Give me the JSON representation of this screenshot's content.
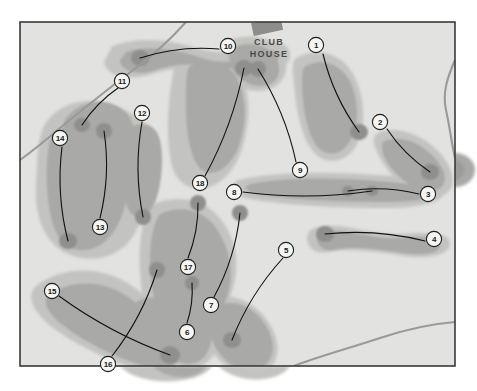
{
  "map": {
    "title": "Golf Course Layout Map",
    "clubhouse_label_line1": "CLUB",
    "clubhouse_label_line2": "HOUSE",
    "colors": {
      "page_background": "#ffffff",
      "map_background": "#e2e2e0",
      "rough": "#c3c3c1",
      "fairway": "#a9a9a7",
      "green": "#8f8f8d",
      "border": "#3a3a3a",
      "river": "#9a9a98",
      "marker_fill": "#f4f4f2",
      "marker_stroke": "#1f1f1f",
      "hole_line": "#111111",
      "clubhouse_fill": "#8d8d8b",
      "text": "#1a1a1a"
    },
    "frame": {
      "x": 20,
      "y": 22,
      "width": 435,
      "height": 344
    },
    "holes": [
      {
        "number": "1",
        "marker_x": 316,
        "marker_y": 45,
        "tee_x": 323,
        "tee_y": 54,
        "green_x": 359,
        "green_y": 132
      },
      {
        "number": "2",
        "marker_x": 380,
        "marker_y": 122,
        "tee_x": 387,
        "tee_y": 129,
        "green_x": 430,
        "green_y": 172
      },
      {
        "number": "3",
        "marker_x": 428,
        "marker_y": 194,
        "tee_x": 419,
        "tee_y": 194,
        "green_x": 348,
        "green_y": 191
      },
      {
        "number": "4",
        "marker_x": 434,
        "marker_y": 239,
        "tee_x": 425,
        "tee_y": 241,
        "green_x": 325,
        "green_y": 234
      },
      {
        "number": "5",
        "marker_x": 286,
        "marker_y": 250,
        "tee_x": 283,
        "tee_y": 258,
        "green_x": 232,
        "green_y": 340
      },
      {
        "number": "6",
        "marker_x": 187,
        "marker_y": 332,
        "tee_x": 187,
        "tee_y": 323,
        "green_x": 192,
        "green_y": 283
      },
      {
        "number": "7",
        "marker_x": 211,
        "marker_y": 305,
        "tee_x": 214,
        "tee_y": 297,
        "green_x": 240,
        "green_y": 213
      },
      {
        "number": "8",
        "marker_x": 234,
        "marker_y": 192,
        "tee_x": 243,
        "tee_y": 192,
        "green_x": 372,
        "green_y": 191
      },
      {
        "number": "9",
        "marker_x": 300,
        "marker_y": 170,
        "tee_x": 296,
        "tee_y": 162,
        "green_x": 258,
        "green_y": 69
      },
      {
        "number": "10",
        "marker_x": 228,
        "marker_y": 46,
        "tee_x": 219,
        "tee_y": 49,
        "green_x": 140,
        "green_y": 58
      },
      {
        "number": "11",
        "marker_x": 122,
        "marker_y": 81,
        "tee_x": 118,
        "tee_y": 88,
        "green_x": 82,
        "green_y": 125
      },
      {
        "number": "12",
        "marker_x": 142,
        "marker_y": 113,
        "tee_x": 142,
        "tee_y": 122,
        "green_x": 143,
        "green_y": 217
      },
      {
        "number": "13",
        "marker_x": 100,
        "marker_y": 227,
        "tee_x": 100,
        "tee_y": 218,
        "green_x": 104,
        "green_y": 131
      },
      {
        "number": "14",
        "marker_x": 60,
        "marker_y": 138,
        "tee_x": 62,
        "tee_y": 147,
        "green_x": 68,
        "green_y": 241
      },
      {
        "number": "15",
        "marker_x": 52,
        "marker_y": 291,
        "tee_x": 59,
        "tee_y": 296,
        "green_x": 170,
        "green_y": 355
      },
      {
        "number": "16",
        "marker_x": 108,
        "marker_y": 364,
        "tee_x": 112,
        "tee_y": 356,
        "green_x": 157,
        "green_y": 270
      },
      {
        "number": "17",
        "marker_x": 188,
        "marker_y": 267,
        "tee_x": 188,
        "tee_y": 258,
        "green_x": 198,
        "green_y": 203
      },
      {
        "number": "18",
        "marker_x": 200,
        "marker_y": 183,
        "tee_x": 205,
        "tee_y": 176,
        "green_x": 244,
        "green_y": 68
      }
    ],
    "clubhouse": {
      "x": 252,
      "y": 20,
      "width": 30,
      "height": 13,
      "rotation": -12
    },
    "text_positions": {
      "club_x": 269,
      "club_y": 45,
      "house_x": 269,
      "house_y": 57
    }
  }
}
